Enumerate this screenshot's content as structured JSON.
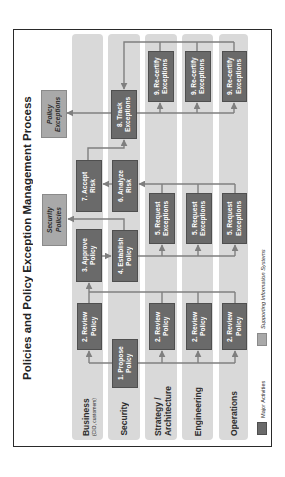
{
  "title": "Policies and Policy Exception Management Process",
  "lanes": [
    {
      "label": "Business",
      "sublabel": "(CIO, customers)"
    },
    {
      "label": "Security"
    },
    {
      "label": "Strategy /",
      "label2": "Architecture"
    },
    {
      "label": "Engineering"
    },
    {
      "label": "Operations"
    }
  ],
  "activities": {
    "propose": [
      "1. Propose",
      "Policy"
    ],
    "review_business": [
      "2. Review",
      "Policy"
    ],
    "review_strategy": [
      "2. Review",
      "Policy"
    ],
    "review_engineering": [
      "2. Review",
      "Policy"
    ],
    "review_operations": [
      "2. Review",
      "Policy"
    ],
    "approve": [
      "3. Approve",
      "Policy"
    ],
    "establish": [
      "4. Establish",
      "Policy"
    ],
    "request_strategy": [
      "5. Request",
      "Exceptions"
    ],
    "request_engineering": [
      "5. Request",
      "Exceptions"
    ],
    "request_operations": [
      "5. Request",
      "Exceptions"
    ],
    "analyze": [
      "6. Analyze",
      "Risk"
    ],
    "accept": [
      "7. Accept",
      "Risk"
    ],
    "track": [
      "8. Track",
      "Exceptions"
    ],
    "recertify_strategy": [
      "9. Re-certify",
      "Exceptions"
    ],
    "recertify_engineering": [
      "9. Re-certify",
      "Exceptions"
    ],
    "recertify_operations": [
      "9. Re-certify",
      "Exceptions"
    ]
  },
  "systems": {
    "security_policies": [
      "Security",
      "Policies"
    ],
    "policy_exceptions": [
      "Policy",
      "Exceptions"
    ]
  },
  "legend": {
    "major": "Major Activities",
    "supporting": "Supporting Information Systems"
  },
  "colors": {
    "lane": "#d9d9d9",
    "major_activity": "#6a6a6a",
    "supporting_system": "#a9a9a9",
    "connector": "#7f7f7f"
  }
}
